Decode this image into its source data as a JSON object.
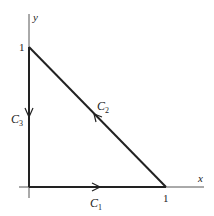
{
  "diagram": {
    "axes": {
      "x_label": "x",
      "y_label": "y"
    },
    "ticks": {
      "x_one": "1",
      "y_one": "1"
    },
    "curves": [
      {
        "name": "C",
        "sub": "1",
        "from": "(0,0)",
        "to": "(1,0)"
      },
      {
        "name": "C",
        "sub": "2",
        "from": "(1,0)",
        "to": "(0,1)"
      },
      {
        "name": "C",
        "sub": "3",
        "from": "(0,1)",
        "to": "(0,0)"
      }
    ],
    "colors": {
      "line": "#222222",
      "axis": "#555555"
    }
  }
}
